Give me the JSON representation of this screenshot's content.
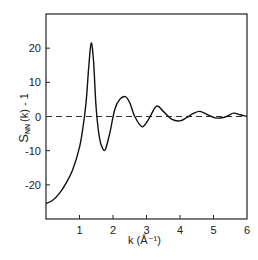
{
  "chart_data": {
    "type": "line",
    "title": "",
    "xlabel": "k (Å⁻¹)",
    "ylabel": "S_NN(k) - 1",
    "xlim": [
      0,
      6
    ],
    "ylim": [
      -30,
      30
    ],
    "x_ticks": [
      1,
      2,
      3,
      4,
      5,
      6
    ],
    "y_ticks": [
      20,
      10,
      0,
      -10,
      -20
    ],
    "grid": false,
    "legend": null,
    "reference_line": {
      "y": 0,
      "style": "dashed"
    },
    "series": [
      {
        "name": "S_NN(k) - 1",
        "x": [
          0.0,
          0.2,
          0.4,
          0.6,
          0.8,
          1.0,
          1.1,
          1.2,
          1.28,
          1.35,
          1.42,
          1.5,
          1.6,
          1.7,
          1.78,
          1.9,
          2.05,
          2.2,
          2.37,
          2.5,
          2.65,
          2.87,
          3.05,
          3.3,
          3.5,
          3.75,
          4.0,
          4.2,
          4.4,
          4.6,
          4.85,
          5.05,
          5.3,
          5.45,
          5.6,
          5.8,
          6.0
        ],
        "y": [
          -25.5,
          -24.5,
          -22.5,
          -19.5,
          -15.5,
          -9.0,
          -3.5,
          4.5,
          15.0,
          21.5,
          16.0,
          2.0,
          -6.5,
          -9.5,
          -9.5,
          -5.0,
          2.0,
          5.0,
          5.8,
          4.0,
          0.0,
          -3.0,
          -1.0,
          3.0,
          1.5,
          -0.8,
          -1.3,
          -0.3,
          0.9,
          1.5,
          0.4,
          -0.4,
          -0.3,
          0.3,
          1.0,
          0.5,
          0.0
        ]
      }
    ]
  },
  "labels": {
    "x_ticks": [
      "1",
      "2",
      "3",
      "4",
      "5",
      "6"
    ],
    "y_ticks": [
      "20",
      "10",
      "0",
      "-10",
      "-20"
    ],
    "xlabel": "k (Å⁻¹)",
    "ylabel": "S",
    "ylabel_sub": "NN",
    "ylabel_rest": "(k) - 1"
  }
}
